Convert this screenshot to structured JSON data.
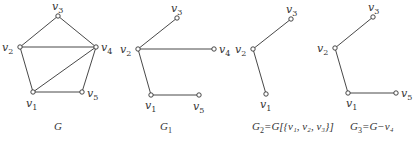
{
  "colors": {
    "stroke": "#333333",
    "background": "#ffffff",
    "vertex_fill": "#ffffff"
  },
  "graphs": [
    {
      "id": "G",
      "caption": {
        "main": "G",
        "sub": "",
        "rest": "",
        "x": 58,
        "y": 130
      },
      "vertices": [
        {
          "id": "v1",
          "base": "v",
          "sub": "1",
          "x": 33,
          "y": 92,
          "lx": 26,
          "ly": 107
        },
        {
          "id": "v2",
          "base": "v",
          "sub": "2",
          "x": 20,
          "y": 47,
          "lx": 2,
          "ly": 51
        },
        {
          "id": "v3",
          "base": "v",
          "sub": "3",
          "x": 58,
          "y": 16,
          "lx": 52,
          "ly": 10
        },
        {
          "id": "v4",
          "base": "v",
          "sub": "4",
          "x": 96,
          "y": 47,
          "lx": 101,
          "ly": 51
        },
        {
          "id": "v5",
          "base": "v",
          "sub": "5",
          "x": 82,
          "y": 92,
          "lx": 87,
          "ly": 97
        }
      ],
      "edges": [
        [
          "v2",
          "v3"
        ],
        [
          "v3",
          "v4"
        ],
        [
          "v2",
          "v4"
        ],
        [
          "v2",
          "v1"
        ],
        [
          "v1",
          "v4"
        ],
        [
          "v1",
          "v5"
        ],
        [
          "v5",
          "v4"
        ]
      ]
    },
    {
      "id": "G1",
      "caption": {
        "main": "G",
        "sub": "1",
        "rest": "",
        "x": 166,
        "y": 130
      },
      "vertices": [
        {
          "id": "v1",
          "base": "v",
          "sub": "1",
          "x": 151,
          "y": 95,
          "lx": 145,
          "ly": 109
        },
        {
          "id": "v2",
          "base": "v",
          "sub": "2",
          "x": 138,
          "y": 49,
          "lx": 120,
          "ly": 53
        },
        {
          "id": "v3",
          "base": "v",
          "sub": "3",
          "x": 177,
          "y": 18,
          "lx": 171,
          "ly": 12
        },
        {
          "id": "v4",
          "base": "v",
          "sub": "4",
          "x": 214,
          "y": 49,
          "lx": 219,
          "ly": 53
        },
        {
          "id": "v5",
          "base": "v",
          "sub": "5",
          "x": 199,
          "y": 95,
          "lx": 193,
          "ly": 110
        }
      ],
      "edges": [
        [
          "v2",
          "v3"
        ],
        [
          "v2",
          "v4"
        ],
        [
          "v2",
          "v1"
        ],
        [
          "v1",
          "v5"
        ]
      ]
    },
    {
      "id": "G2",
      "caption": {
        "main": "G",
        "sub": "2",
        "rest": "=G[{v₁, v₂, v₃}]",
        "x": 252,
        "y": 130
      },
      "vertices": [
        {
          "id": "v1",
          "base": "v",
          "sub": "1",
          "x": 266,
          "y": 94,
          "lx": 260,
          "ly": 108
        },
        {
          "id": "v2",
          "base": "v",
          "sub": "2",
          "x": 253,
          "y": 49,
          "lx": 235,
          "ly": 53
        },
        {
          "id": "v3",
          "base": "v",
          "sub": "3",
          "x": 291,
          "y": 19,
          "lx": 286,
          "ly": 13
        }
      ],
      "edges": [
        [
          "v2",
          "v3"
        ],
        [
          "v2",
          "v1"
        ]
      ]
    },
    {
      "id": "G3",
      "caption": {
        "main": "G",
        "sub": "3",
        "rest": "=G−v₄",
        "x": 350,
        "y": 130
      },
      "vertices": [
        {
          "id": "v1",
          "base": "v",
          "sub": "1",
          "x": 348,
          "y": 93,
          "lx": 346,
          "ly": 107
        },
        {
          "id": "v2",
          "base": "v",
          "sub": "2",
          "x": 335,
          "y": 48,
          "lx": 317,
          "ly": 52
        },
        {
          "id": "v3",
          "base": "v",
          "sub": "3",
          "x": 373,
          "y": 17,
          "lx": 368,
          "ly": 11
        },
        {
          "id": "v5",
          "base": "v",
          "sub": "5",
          "x": 396,
          "y": 93,
          "lx": 401,
          "ly": 97
        }
      ],
      "edges": [
        [
          "v2",
          "v3"
        ],
        [
          "v2",
          "v1"
        ],
        [
          "v1",
          "v5"
        ]
      ]
    }
  ]
}
